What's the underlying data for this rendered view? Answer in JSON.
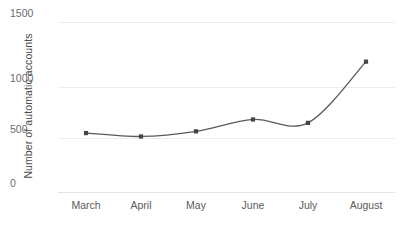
{
  "chart_data": {
    "type": "line",
    "title": "",
    "xlabel": "",
    "ylabel": "Number of automatic accounts",
    "categories": [
      "March",
      "April",
      "May",
      "June",
      "July",
      "August"
    ],
    "values": [
      520,
      490,
      535,
      640,
      610,
      1150
    ],
    "series": [
      {
        "name": "Number of automatic accounts",
        "values": [
          520,
          490,
          535,
          640,
          610,
          1150
        ]
      }
    ],
    "ylim": [
      0,
      1500
    ],
    "yticks": [
      0,
      500,
      1000,
      1500
    ],
    "ytick_labels": [
      "0",
      "500",
      "1000",
      "1500"
    ],
    "grid": true,
    "legend": "none",
    "markers": true,
    "line_color": "#595959",
    "marker_color": "#444444",
    "grid_color": "#ededf0",
    "background": "#ffffff"
  },
  "axes": {
    "y_title": "Number of automatic accounts",
    "y_ticks": [
      {
        "label": "1500",
        "value": 1500
      },
      {
        "label": "1000",
        "value": 1000
      },
      {
        "label": "500",
        "value": 500
      },
      {
        "label": "0",
        "value": 0
      }
    ],
    "x_ticks": [
      {
        "label": "March"
      },
      {
        "label": "April"
      },
      {
        "label": "May"
      },
      {
        "label": "June"
      },
      {
        "label": "July"
      },
      {
        "label": "August"
      }
    ]
  }
}
